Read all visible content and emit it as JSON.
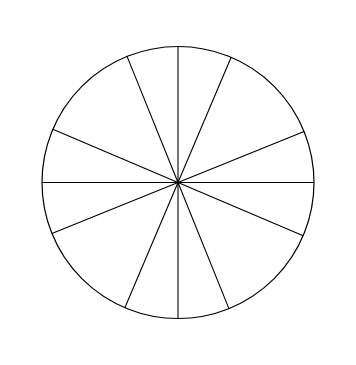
{
  "chart_data": {
    "type": "scatter",
    "title": "",
    "subtitle": "",
    "xlabel": "",
    "ylabel": "",
    "projection": "polar",
    "grid": false,
    "legend_position": "none",
    "radial_axis": {
      "rlim": [
        0,
        1.0
      ],
      "horizontal_tick_labels": [
        "-0.8",
        "-0.6",
        "-0.4",
        "0.4",
        "0.6",
        "0.8"
      ],
      "vertical_tick_labels": [
        "0.8",
        "0.6",
        "0.4",
        "-0.4",
        "-0.6",
        "-0.8"
      ],
      "tick_values": [
        -0.8,
        -0.6,
        -0.4,
        -0.2,
        0.2,
        0.4,
        0.6,
        0.8
      ],
      "labeled_tick_values": [
        -0.8,
        -0.6,
        -0.4,
        0.4,
        0.6,
        0.8
      ],
      "unlabeled_tick_values": [
        -0.2,
        0.2
      ]
    },
    "angular_axis": {
      "units": "degrees",
      "direction": "counterclockwise",
      "zero_location": "east",
      "sector_boundary_angles": [
        22,
        67,
        112,
        157,
        202,
        247,
        292,
        337
      ],
      "sector_boundary_labels": [
        "22°",
        "67°",
        "112°",
        "157°",
        "202°",
        "247°",
        "292°",
        "337°"
      ]
    },
    "direction_labels": [
      {
        "code": "LM",
        "angle_label": "0°",
        "angle": 0
      },
      {
        "code": "NO",
        "angle_label": "45°",
        "angle": 45
      },
      {
        "code": "PA",
        "angle_label": "90°",
        "angle": 90
      },
      {
        "code": "BC",
        "angle_label": "135°",
        "angle": 135
      },
      {
        "code": "DE",
        "angle_label": "180°",
        "angle": 180
      },
      {
        "code": "FG",
        "angle_label": "225°",
        "angle": 225
      },
      {
        "code": "HI",
        "angle_label": "270°",
        "angle": 270
      },
      {
        "code": "JK",
        "angle_label": "315°",
        "angle": 315
      }
    ],
    "series": [
      {
        "name": "data points",
        "marker": "square",
        "color": "#000000",
        "points": [
          {
            "label": "LM",
            "angle": 0,
            "radius": 1.0
          },
          {
            "label": "NO",
            "angle": 45,
            "radius": 0.8
          },
          {
            "label": "PA",
            "angle": 90,
            "radius": 1.0
          },
          {
            "label": "BC",
            "angle": 135,
            "radius": 0.8
          },
          {
            "label": "DE",
            "angle": 180,
            "radius": 1.0
          },
          {
            "label": "FG",
            "angle": 225,
            "radius": 0.8
          },
          {
            "label": "HI",
            "angle": 270,
            "radius": 1.0
          },
          {
            "label": "JK",
            "angle": 315,
            "radius": 0.8
          }
        ]
      }
    ]
  },
  "colors": {
    "background": "#ffffff",
    "foreground": "#000000",
    "marker": "#000000"
  }
}
